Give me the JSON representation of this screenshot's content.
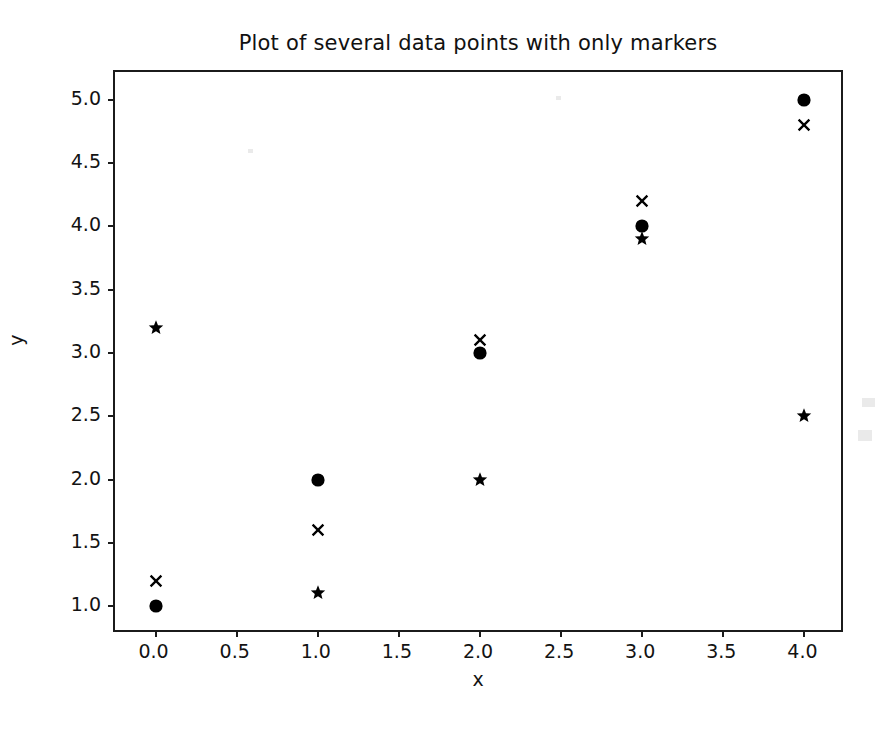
{
  "chart_data": {
    "type": "scatter",
    "title": "Plot of several data points with only markers",
    "xlabel": "x",
    "ylabel": "y",
    "xlim": [
      -0.25,
      4.25
    ],
    "ylim": [
      0.78,
      5.22
    ],
    "xticks": [
      0.0,
      0.5,
      1.0,
      1.5,
      2.0,
      2.5,
      3.0,
      3.5,
      4.0
    ],
    "xticklabels": [
      "0.0",
      "0.5",
      "1.0",
      "1.5",
      "2.0",
      "2.5",
      "3.0",
      "3.5",
      "4.0"
    ],
    "yticks": [
      1.0,
      1.5,
      2.0,
      2.5,
      3.0,
      3.5,
      4.0,
      4.5,
      5.0
    ],
    "yticklabels": [
      "1.0",
      "1.5",
      "2.0",
      "2.5",
      "3.0",
      "3.5",
      "4.0",
      "4.5",
      "5.0"
    ],
    "grid": false,
    "legend": null,
    "marker_color": "#000000",
    "x": [
      0,
      1,
      2,
      3,
      4
    ],
    "series": [
      {
        "name": "circle-series",
        "marker": "o",
        "color": "#000000",
        "values": [
          1.0,
          2.0,
          3.0,
          4.0,
          5.0
        ]
      },
      {
        "name": "cross-series",
        "marker": "x",
        "color": "#000000",
        "values": [
          1.2,
          1.6,
          3.1,
          4.2,
          4.8
        ]
      },
      {
        "name": "star-series",
        "marker": "*",
        "color": "#000000",
        "values": [
          3.2,
          1.1,
          2.0,
          3.9,
          2.5
        ]
      }
    ]
  }
}
